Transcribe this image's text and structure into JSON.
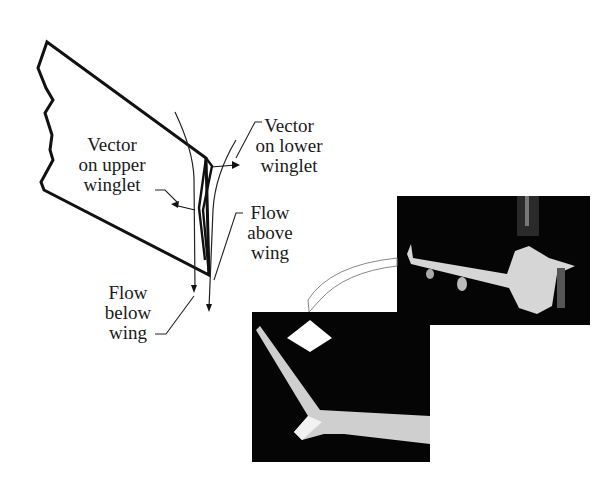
{
  "figure": {
    "labels": {
      "vector_upper": [
        "Vector",
        "on upper",
        "winglet"
      ],
      "vector_lower": [
        "Vector",
        "on lower",
        "winglet"
      ],
      "flow_above": [
        "Flow",
        "above",
        "wing"
      ],
      "flow_below": [
        "Flow",
        "below",
        "wing"
      ]
    },
    "photos": {
      "aircraft_model": "wind-tunnel photo of aircraft model",
      "winglet_closeup": "close-up photo of wingtip winglet"
    },
    "colors": {
      "line": "#111111",
      "photo_bg": "#050505",
      "highlight": "#e8e8e8"
    }
  }
}
